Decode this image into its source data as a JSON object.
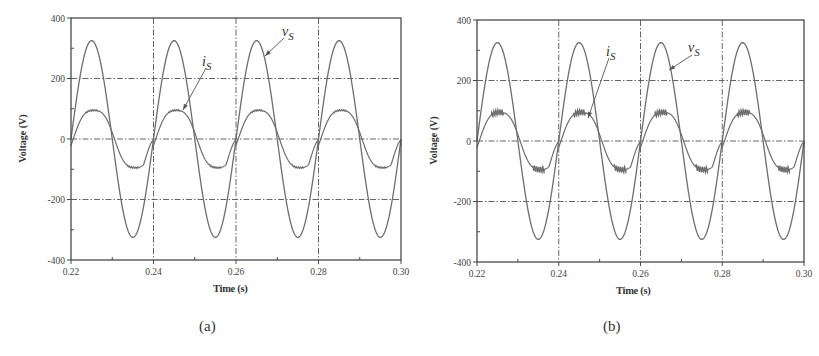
{
  "chart_data": [
    {
      "id": "a",
      "type": "line",
      "caption": "(a)",
      "title": "",
      "xlabel": "Time (s)",
      "ylabel": "Voltage (V)",
      "xlim": [
        0.22,
        0.3
      ],
      "ylim": [
        -400,
        400
      ],
      "xticks": [
        "0.22",
        "0.24",
        "0.26",
        "0.28",
        "0.30"
      ],
      "yticks": [
        "400",
        "200",
        "0",
        "-200",
        "-400"
      ],
      "grid": "dash-dot at major ticks",
      "series": [
        {
          "name": "v_S",
          "label_main": "v",
          "label_sub": "S",
          "kind": "sine",
          "amplitude": 325,
          "frequency_hz": 50,
          "phase_deg": 0
        },
        {
          "name": "i_S",
          "label_main": "i",
          "label_sub": "S",
          "kind": "distorted-sine",
          "amplitude": 105,
          "frequency_hz": 50,
          "phase_deg": -10,
          "ripple": "low"
        }
      ],
      "sample_points": {
        "x": [
          0.22,
          0.225,
          0.23,
          0.235,
          0.24,
          0.245,
          0.25,
          0.255,
          0.26,
          0.265,
          0.27,
          0.275,
          0.28,
          0.285,
          0.29,
          0.295,
          0.3
        ],
        "v_S": [
          0,
          325,
          0,
          -325,
          0,
          325,
          0,
          -325,
          0,
          325,
          0,
          -325,
          0,
          325,
          0,
          -325,
          0
        ],
        "i_S": [
          0,
          95,
          15,
          -105,
          0,
          100,
          15,
          -105,
          0,
          95,
          15,
          -105,
          0,
          95,
          15,
          -105,
          0
        ]
      },
      "annotations": [
        {
          "text": "v_S",
          "points_to": "voltage curve near t=0.267"
        },
        {
          "text": "i_S",
          "points_to": "current curve near t=0.247"
        }
      ]
    },
    {
      "id": "b",
      "type": "line",
      "caption": "(b)",
      "title": "",
      "xlabel": "Time (s)",
      "ylabel": "Voltage (V)",
      "xlim": [
        0.22,
        0.3
      ],
      "ylim": [
        -400,
        400
      ],
      "xticks": [
        "0.22",
        "0.24",
        "0.26",
        "0.28",
        "0.30"
      ],
      "yticks": [
        "400",
        "200",
        "0",
        "-200",
        "-400"
      ],
      "grid": "dash-dot at major ticks",
      "series": [
        {
          "name": "v_S",
          "label_main": "v",
          "label_sub": "S",
          "kind": "sine",
          "amplitude": 325,
          "frequency_hz": 50,
          "phase_deg": 0
        },
        {
          "name": "i_S",
          "label_main": "i",
          "label_sub": "S",
          "kind": "distorted-sine",
          "amplitude": 100,
          "frequency_hz": 50,
          "phase_deg": -10,
          "ripple": "high"
        }
      ],
      "sample_points": {
        "x": [
          0.22,
          0.225,
          0.23,
          0.235,
          0.24,
          0.245,
          0.25,
          0.255,
          0.26,
          0.265,
          0.27,
          0.275,
          0.28,
          0.285,
          0.29,
          0.295,
          0.3
        ],
        "v_S": [
          0,
          325,
          0,
          -325,
          0,
          325,
          0,
          -325,
          0,
          325,
          0,
          -325,
          0,
          325,
          0,
          -325,
          0
        ],
        "i_S": [
          0,
          95,
          15,
          -105,
          0,
          100,
          15,
          -105,
          0,
          95,
          15,
          -105,
          0,
          95,
          15,
          -105,
          0
        ]
      },
      "annotations": [
        {
          "text": "i_S",
          "points_to": "current curve near t=0.247"
        },
        {
          "text": "v_S",
          "points_to": "voltage curve near t=0.266"
        }
      ]
    }
  ],
  "style": {
    "line_color": "#6e6e6e",
    "axis_color": "#4a4a4a",
    "grid_color": "#555555",
    "text_color": "#333333"
  },
  "panels": {
    "a": {
      "ylabel": "Voltage (V)",
      "xlabel": "Time (s)",
      "caption": "(a)"
    },
    "b": {
      "ylabel": "Voltage (V)",
      "xlabel": "Time (s)",
      "caption": "(b)"
    }
  }
}
